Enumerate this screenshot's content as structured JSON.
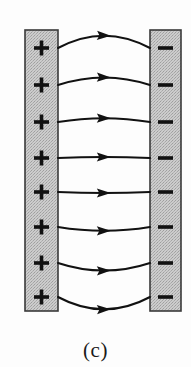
{
  "figure": {
    "caption": "(c)",
    "caption_x": 95,
    "caption_y": 338,
    "caption_font_size": 21,
    "background_color": "#fdfdfd",
    "width": 191,
    "height": 367
  },
  "colors": {
    "plate_fill": "#c9c9c9",
    "plate_stipple_dark": "#a9a9a9",
    "plate_border": "#3a3a3a",
    "field_line": "#111111",
    "charge_glyph": "#111111",
    "background": "#fdfdfd"
  },
  "plates": [
    {
      "id": "positive-plate",
      "polarity": "positive",
      "charge_symbol": "+",
      "charge_count": 8,
      "x": 25,
      "y": 30,
      "width": 33,
      "height": 281,
      "label": "Positively charged plate"
    },
    {
      "id": "negative-plate",
      "polarity": "negative",
      "charge_symbol": "−",
      "charge_count": 8,
      "x": 150,
      "y": 30,
      "width": 31,
      "height": 281,
      "label": "Negatively charged plate"
    }
  ],
  "charge_rows_y": [
    48,
    85,
    122,
    158,
    192,
    227,
    263,
    297
  ],
  "field_lines": {
    "count": 8,
    "direction": "left-to-right",
    "start_x": 58,
    "end_x": 150,
    "arrow_position": 0.52,
    "lines": [
      {
        "index": 0,
        "y_start": 48,
        "y_end": 48,
        "bow": -13
      },
      {
        "index": 1,
        "y_start": 85,
        "y_end": 85,
        "bow": -8
      },
      {
        "index": 2,
        "y_start": 122,
        "y_end": 122,
        "bow": -4
      },
      {
        "index": 3,
        "y_start": 158,
        "y_end": 158,
        "bow": -1
      },
      {
        "index": 4,
        "y_start": 192,
        "y_end": 192,
        "bow": 1
      },
      {
        "index": 5,
        "y_start": 227,
        "y_end": 227,
        "bow": 4
      },
      {
        "index": 6,
        "y_start": 263,
        "y_end": 263,
        "bow": 8
      },
      {
        "index": 7,
        "y_start": 297,
        "y_end": 297,
        "bow": 13
      }
    ]
  },
  "chart_data": {
    "type": "diagram",
    "title": "(c)",
    "elements": [
      {
        "name": "positive-plate",
        "symbol": "+",
        "count": 8,
        "side": "left"
      },
      {
        "name": "negative-plate",
        "symbol": "−",
        "count": 8,
        "side": "right"
      },
      {
        "name": "field-lines",
        "count": 8,
        "direction": "left-to-right"
      }
    ]
  }
}
